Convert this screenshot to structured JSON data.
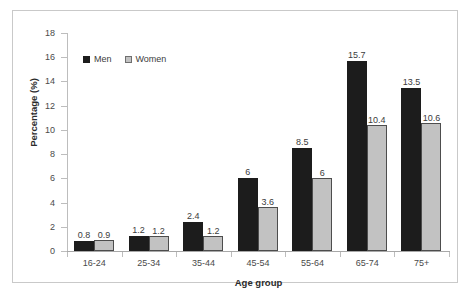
{
  "chart_data": {
    "type": "bar",
    "title": "",
    "xlabel": "Age group",
    "ylabel": "Percentage (%)",
    "categories": [
      "16-24",
      "25-34",
      "35-44",
      "45-54",
      "55-64",
      "65-74",
      "75+"
    ],
    "series": [
      {
        "name": "Men",
        "values": [
          0.8,
          1.2,
          2.4,
          6,
          8.5,
          15.7,
          13.5
        ]
      },
      {
        "name": "Women",
        "values": [
          0.9,
          1.2,
          1.2,
          3.6,
          6,
          10.4,
          10.6
        ]
      }
    ],
    "value_labels": {
      "Men": [
        "0.8",
        "1.2",
        "2.4",
        "6",
        "8.5",
        "15.7",
        "13.5"
      ],
      "Women": [
        "0.9",
        "1.2",
        "1.2",
        "3.6",
        "6",
        "10.4",
        "10.6"
      ]
    },
    "ylim": [
      0,
      18
    ],
    "yticks": [
      0,
      2,
      4,
      6,
      8,
      10,
      12,
      14,
      16,
      18
    ],
    "ytick_labels": [
      "0",
      "2",
      "4",
      "6",
      "8",
      "10",
      "12",
      "14",
      "16",
      "18"
    ],
    "grid": false,
    "legend": {
      "position": "top-left",
      "entries": [
        "Men",
        "Women"
      ]
    },
    "colors": {
      "Men": "#1c1c1c",
      "Women": "#c2c2c2",
      "women_edge": "#4d4d4d",
      "axis": "#bdbdbd",
      "frame": "#c9c9c9",
      "text": "#3c3c3c"
    }
  }
}
